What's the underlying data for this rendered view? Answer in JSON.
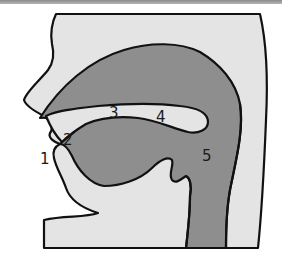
{
  "diagram": {
    "colors": {
      "skin": "#e4e4e4",
      "cavity": "#8e8e8e",
      "outline": "#111111",
      "background": "#ffffff",
      "label": "#1a1a1a"
    },
    "labels": [
      {
        "id": "1",
        "text": "1",
        "x": 40,
        "y": 152
      },
      {
        "id": "2",
        "text": "2",
        "x": 63,
        "y": 133
      },
      {
        "id": "3",
        "text": "3",
        "x": 109,
        "y": 106
      },
      {
        "id": "4",
        "text": "4",
        "x": 156,
        "y": 110
      },
      {
        "id": "5",
        "text": "5",
        "x": 202,
        "y": 149
      }
    ]
  }
}
